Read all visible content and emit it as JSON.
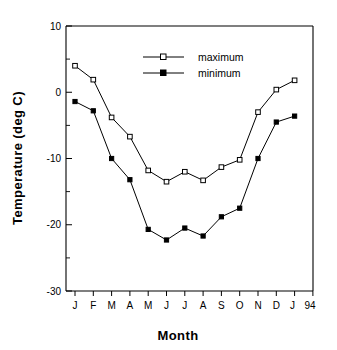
{
  "chart_data": {
    "type": "line",
    "title": "",
    "xlabel": "Month",
    "ylabel": "Temperature  (deg C)",
    "categories": [
      "J",
      "F",
      "M",
      "A",
      "M",
      "J",
      "J",
      "A",
      "S",
      "O",
      "N",
      "D",
      "J",
      "94"
    ],
    "x_tick_labels": [
      "J",
      "F",
      "M",
      "A",
      "M",
      "J",
      "J",
      "A",
      "S",
      "O",
      "N",
      "D",
      "J",
      "94"
    ],
    "y_tick_labels": [
      "10",
      "0",
      "-10",
      "-20",
      "-30"
    ],
    "y_ticks": [
      10,
      0,
      -10,
      -20,
      -30
    ],
    "ylim": [
      -30,
      10
    ],
    "xlim": [
      0,
      13
    ],
    "grid": false,
    "legend_position": "top-center",
    "series": [
      {
        "name": "maximum",
        "marker": "open-square",
        "values": [
          4.0,
          1.9,
          -3.8,
          -6.7,
          -11.8,
          -13.5,
          -12.0,
          -13.3,
          -11.3,
          -10.2,
          -3.0,
          0.4,
          1.8,
          null
        ]
      },
      {
        "name": "minimum",
        "marker": "filled-square",
        "values": [
          -1.4,
          -2.8,
          -10.0,
          -13.2,
          -20.7,
          -22.3,
          -20.5,
          -21.7,
          -18.8,
          -17.5,
          -10.0,
          -4.5,
          -3.6,
          null
        ]
      }
    ]
  },
  "legend": {
    "entries": [
      {
        "label": "maximum"
      },
      {
        "label": "minimum"
      }
    ]
  },
  "axes": {
    "x_title": "Month",
    "y_title": "Temperature  (deg C)"
  }
}
